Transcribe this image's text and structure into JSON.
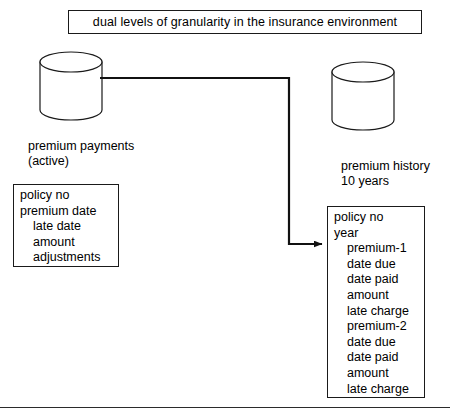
{
  "title": {
    "text": "dual levels of granularity in the insurance environment"
  },
  "stores": {
    "active": {
      "icon": "database-cylinder-icon",
      "label": "premium payments\n(active)",
      "attributes": [
        {
          "text": "policy no",
          "indent": false
        },
        {
          "text": "premium date",
          "indent": false
        },
        {
          "text": "late date",
          "indent": true
        },
        {
          "text": "amount",
          "indent": true
        },
        {
          "text": "adjustments",
          "indent": true
        }
      ]
    },
    "history": {
      "icon": "database-cylinder-icon",
      "label": "premium history\n10 years",
      "attributes": [
        {
          "text": "policy no",
          "indent": false
        },
        {
          "text": "year",
          "indent": false
        },
        {
          "text": "premium-1",
          "indent": true
        },
        {
          "text": "date due",
          "indent": true
        },
        {
          "text": "date paid",
          "indent": true
        },
        {
          "text": "amount",
          "indent": true
        },
        {
          "text": "late charge",
          "indent": true
        },
        {
          "text": "premium-2",
          "indent": true
        },
        {
          "text": "date due",
          "indent": true
        },
        {
          "text": "date paid",
          "indent": true
        },
        {
          "text": "amount",
          "indent": true
        },
        {
          "text": "late charge",
          "indent": true
        }
      ]
    }
  },
  "connector": {
    "name": "active-to-history-arrow",
    "from": "premium payments (active)",
    "to": "premium history 10 years"
  },
  "colors": {
    "stroke": "#1a1a1a",
    "background": "#ffffff",
    "text": "#000000",
    "rule": "#2b2b2b"
  }
}
